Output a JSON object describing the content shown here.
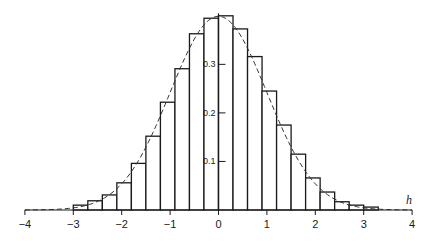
{
  "chart_data": {
    "type": "bar",
    "subtype": "histogram_with_density_curve",
    "title": "",
    "xlabel": "h",
    "ylabel": "",
    "xlim": [
      -4,
      4
    ],
    "ylim": [
      0,
      0.4
    ],
    "x_ticks": [
      -4,
      -3,
      -2,
      -1,
      0,
      1,
      2,
      3,
      4
    ],
    "x_tick_labels": [
      "−4",
      "−3",
      "−2",
      "−1",
      "0",
      "1",
      "2",
      "3",
      "4"
    ],
    "y_ticks": [
      0.1,
      0.2,
      0.3
    ],
    "y_tick_labels": [
      "0.1",
      "0.2",
      "0.3"
    ],
    "grid": false,
    "legend": null,
    "bin_width": 0.3,
    "bin_edges_left": [
      -3.0,
      -2.7,
      -2.4,
      -2.1,
      -1.8,
      -1.5,
      -1.2,
      -0.9,
      -0.6,
      -0.3,
      0.0,
      0.3,
      0.6,
      0.9,
      1.2,
      1.5,
      1.8,
      2.1,
      2.4,
      2.7,
      3.0
    ],
    "values": [
      0.01,
      0.019,
      0.031,
      0.056,
      0.096,
      0.152,
      0.222,
      0.291,
      0.363,
      0.395,
      0.4,
      0.373,
      0.316,
      0.245,
      0.175,
      0.115,
      0.066,
      0.037,
      0.017,
      0.01,
      0.006
    ],
    "series": [
      {
        "name": "histogram",
        "kind": "bar"
      },
      {
        "name": "normal density",
        "kind": "line",
        "style": "dashed",
        "function": "standard normal pdf",
        "x_range": [
          -4,
          4
        ]
      }
    ]
  },
  "labels": {
    "x_axis_title": "h"
  }
}
